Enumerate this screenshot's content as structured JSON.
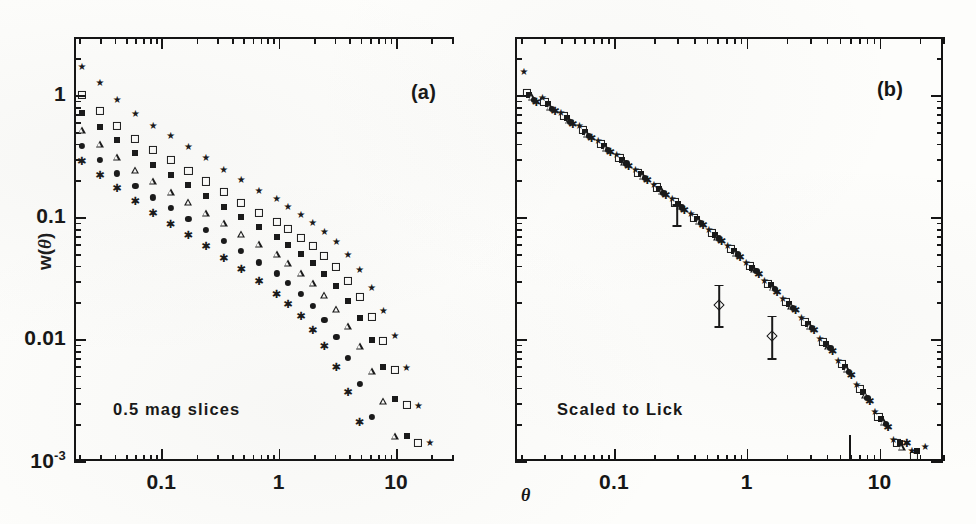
{
  "figure": {
    "type": "scientific-figure",
    "axis_labels": {
      "y": "w(",
      "y_symbol": "θ",
      "y_close": ")",
      "x": "θ"
    }
  },
  "panels": [
    {
      "id": "a",
      "label": "(a)",
      "annotation": "0.5 mag slices"
    },
    {
      "id": "b",
      "label": "(b)",
      "annotation": "Scaled to Lick"
    }
  ],
  "axes": {
    "y_ticks": [
      "1",
      "0.1",
      "0.01",
      "10"
    ],
    "y_last_exponent": "-3",
    "x_ticks_a": [
      "0.1",
      "1",
      "10"
    ],
    "x_ticks_b": [
      "0.1",
      "1",
      "10"
    ],
    "ylim": [
      0.001,
      3.0
    ],
    "xlim": [
      0.018,
      30.0
    ],
    "scale": "log-log"
  },
  "chart_data": {
    "type": "scatter",
    "title": "",
    "xlabel": "θ",
    "ylabel": "w(θ)",
    "xscale": "log",
    "yscale": "log",
    "xlim": [
      0.018,
      30.0
    ],
    "ylim": [
      0.001,
      3.0
    ],
    "grid": false,
    "legend": "none",
    "panels": [
      {
        "id": "a",
        "label": "(a)",
        "annotation": "0.5 mag slices",
        "description": "Angular correlation function w(theta) for six 0.5 magnitude slices; amplitude decreases with fainter magnitude slice.",
        "series": [
          {
            "name": "slice-1-star",
            "marker": "star",
            "x": [
              0.021,
              0.03,
              0.042,
              0.06,
              0.085,
              0.12,
              0.17,
              0.24,
              0.34,
              0.48,
              0.68,
              0.96,
              1.2,
              1.55,
              1.95,
              2.45,
              3.1,
              3.9,
              4.9,
              6.2,
              7.8,
              9.8,
              12.3,
              15.5,
              19.5
            ],
            "y": [
              1.7,
              1.25,
              0.92,
              0.7,
              0.56,
              0.46,
              0.375,
              0.305,
              0.245,
              0.2,
              0.165,
              0.14,
              0.122,
              0.105,
              0.09,
              0.076,
              0.062,
              0.049,
              0.037,
              0.026,
              0.017,
              0.0105,
              0.0058,
              0.0028,
              0.0014
            ]
          },
          {
            "name": "slice-2-open-square",
            "marker": "open-square",
            "x": [
              0.021,
              0.03,
              0.042,
              0.06,
              0.085,
              0.12,
              0.17,
              0.24,
              0.34,
              0.48,
              0.68,
              0.96,
              1.2,
              1.55,
              1.95,
              2.45,
              3.1,
              3.9,
              4.9,
              6.2,
              7.8,
              9.8,
              12.3,
              15.5
            ],
            "y": [
              1.0,
              0.74,
              0.56,
              0.44,
              0.355,
              0.292,
              0.24,
              0.196,
              0.16,
              0.131,
              0.109,
              0.092,
              0.08,
              0.068,
              0.058,
              0.048,
              0.039,
              0.03,
              0.022,
              0.0152,
              0.0096,
              0.0056,
              0.0029,
              0.0014
            ]
          },
          {
            "name": "slice-3-filled-square",
            "marker": "filled-square",
            "x": [
              0.021,
              0.03,
              0.042,
              0.06,
              0.085,
              0.12,
              0.17,
              0.24,
              0.34,
              0.48,
              0.68,
              0.96,
              1.2,
              1.55,
              1.95,
              2.45,
              3.1,
              3.9,
              4.9,
              6.2,
              7.8,
              9.8,
              12.3
            ],
            "y": [
              0.72,
              0.55,
              0.425,
              0.335,
              0.27,
              0.222,
              0.182,
              0.149,
              0.122,
              0.1,
              0.083,
              0.069,
              0.059,
              0.05,
              0.042,
              0.034,
              0.027,
              0.0205,
              0.0148,
              0.0098,
              0.0059,
              0.0032,
              0.0016
            ]
          },
          {
            "name": "slice-4-open-triangle",
            "marker": "open-triangle",
            "x": [
              0.021,
              0.03,
              0.042,
              0.06,
              0.085,
              0.12,
              0.17,
              0.24,
              0.34,
              0.48,
              0.68,
              0.96,
              1.2,
              1.55,
              1.95,
              2.45,
              3.1,
              3.9,
              4.9,
              6.2,
              7.8,
              9.8
            ],
            "y": [
              0.52,
              0.4,
              0.31,
              0.245,
              0.198,
              0.162,
              0.133,
              0.109,
              0.089,
              0.073,
              0.06,
              0.0495,
              0.042,
              0.035,
              0.0288,
              0.023,
              0.0176,
              0.0128,
              0.0088,
              0.0055,
              0.0031,
              0.0016
            ]
          },
          {
            "name": "slice-5-filled-circle",
            "marker": "filled-circle",
            "x": [
              0.021,
              0.03,
              0.042,
              0.06,
              0.085,
              0.12,
              0.17,
              0.24,
              0.34,
              0.48,
              0.68,
              0.96,
              1.2,
              1.55,
              1.95,
              2.45,
              3.1,
              3.9,
              4.9,
              6.2
            ],
            "y": [
              0.385,
              0.295,
              0.228,
              0.18,
              0.145,
              0.119,
              0.097,
              0.079,
              0.064,
              0.0525,
              0.0425,
              0.0345,
              0.0288,
              0.0235,
              0.0188,
              0.0144,
              0.0104,
              0.007,
              0.0043,
              0.0023
            ]
          },
          {
            "name": "slice-6-asterisk",
            "marker": "asterisk",
            "x": [
              0.021,
              0.03,
              0.042,
              0.06,
              0.085,
              0.12,
              0.17,
              0.24,
              0.34,
              0.48,
              0.68,
              0.96,
              1.2,
              1.55,
              1.95,
              2.45,
              3.1,
              3.9,
              4.9
            ],
            "y": [
              0.29,
              0.222,
              0.172,
              0.135,
              0.108,
              0.088,
              0.071,
              0.0575,
              0.0462,
              0.0372,
              0.0298,
              0.0236,
              0.0194,
              0.0154,
              0.0119,
              0.0087,
              0.0059,
              0.0037,
              0.0021
            ]
          }
        ]
      },
      {
        "id": "b",
        "label": "(b)",
        "annotation": "Scaled to Lick",
        "description": "Same six magnitude slices rescaled to the Lick amplitude; all series collapse onto a single power law of slope about -0.8.",
        "series": [
          {
            "name": "scaled-star",
            "marker": "star",
            "x": [
              0.021,
              0.029,
              0.04,
              0.055,
              0.076,
              0.105,
              0.145,
              0.2,
              0.275,
              0.38,
              0.52,
              0.72,
              0.99,
              1.36,
              1.87,
              2.58,
              3.55,
              4.88,
              6.71,
              9.23,
              12.7,
              17.5,
              22.0
            ],
            "y": [
              1.55,
              0.95,
              0.72,
              0.56,
              0.42,
              0.325,
              0.245,
              0.185,
              0.14,
              0.106,
              0.078,
              0.058,
              0.042,
              0.03,
              0.0212,
              0.0148,
              0.01,
              0.0066,
              0.0042,
              0.0025,
              0.0015,
              0.0012,
              0.0013
            ]
          },
          {
            "name": "scaled-open-square",
            "marker": "open-square",
            "x": [
              0.022,
              0.03,
              0.042,
              0.058,
              0.08,
              0.11,
              0.152,
              0.21,
              0.29,
              0.4,
              0.55,
              0.76,
              1.05,
              1.44,
              1.98,
              2.73,
              3.76,
              5.18,
              7.12,
              9.8,
              13.5,
              18.0
            ],
            "y": [
              1.05,
              0.88,
              0.68,
              0.52,
              0.395,
              0.305,
              0.232,
              0.175,
              0.132,
              0.099,
              0.074,
              0.055,
              0.04,
              0.0285,
              0.02,
              0.0138,
              0.0094,
              0.0062,
              0.0039,
              0.0023,
              0.0014,
              0.0011
            ]
          },
          {
            "name": "scaled-filled-square",
            "marker": "filled-square",
            "x": [
              0.023,
              0.032,
              0.044,
              0.061,
              0.084,
              0.116,
              0.16,
              0.22,
              0.305,
              0.42,
              0.58,
              0.8,
              1.1,
              1.52,
              2.09,
              2.88,
              3.96,
              5.45,
              7.5,
              10.3,
              14.2,
              19.0
            ],
            "y": [
              1.0,
              0.84,
              0.65,
              0.5,
              0.385,
              0.295,
              0.225,
              0.17,
              0.128,
              0.096,
              0.072,
              0.053,
              0.0385,
              0.0275,
              0.0194,
              0.0133,
              0.0091,
              0.0059,
              0.0037,
              0.0022,
              0.0014,
              0.0012
            ]
          },
          {
            "name": "scaled-open-triangle",
            "marker": "open-triangle",
            "x": [
              0.024,
              0.033,
              0.046,
              0.063,
              0.087,
              0.12,
              0.166,
              0.229,
              0.316,
              0.436,
              0.601,
              0.829,
              1.14,
              1.58,
              2.17,
              2.99,
              4.12,
              5.68,
              7.82,
              10.8,
              14.8
            ],
            "y": [
              0.96,
              0.8,
              0.62,
              0.48,
              0.37,
              0.285,
              0.218,
              0.165,
              0.124,
              0.093,
              0.069,
              0.051,
              0.0372,
              0.0265,
              0.0186,
              0.0128,
              0.0087,
              0.0057,
              0.0035,
              0.0021,
              0.0013
            ]
          },
          {
            "name": "scaled-filled-circle",
            "marker": "filled-circle",
            "x": [
              0.025,
              0.034,
              0.047,
              0.065,
              0.09,
              0.124,
              0.171,
              0.236,
              0.326,
              0.45,
              0.62,
              0.855,
              1.18,
              1.63,
              2.24,
              3.09,
              4.26,
              5.87,
              8.09,
              11.2
            ],
            "y": [
              0.92,
              0.77,
              0.6,
              0.465,
              0.358,
              0.276,
              0.211,
              0.159,
              0.12,
              0.09,
              0.067,
              0.0495,
              0.036,
              0.0256,
              0.018,
              0.0124,
              0.0084,
              0.0054,
              0.0033,
              0.002
            ]
          },
          {
            "name": "scaled-asterisk",
            "marker": "asterisk",
            "x": [
              0.026,
              0.036,
              0.049,
              0.068,
              0.094,
              0.129,
              0.178,
              0.246,
              0.339,
              0.468,
              0.645,
              0.89,
              1.23,
              1.69,
              2.33,
              3.21,
              4.43,
              6.11,
              8.42,
              11.6,
              16.0
            ],
            "y": [
              0.88,
              0.74,
              0.575,
              0.445,
              0.343,
              0.264,
              0.202,
              0.152,
              0.115,
              0.086,
              0.064,
              0.0473,
              0.0344,
              0.0245,
              0.0172,
              0.0118,
              0.008,
              0.0051,
              0.0031,
              0.0019,
              0.0014
            ]
          }
        ],
        "error_bars": [
          {
            "x": 0.62,
            "y": 0.019,
            "y_low": 0.0128,
            "y_high": 0.028,
            "marker": "open-diamond"
          },
          {
            "x": 1.55,
            "y": 0.0105,
            "y_low": 0.007,
            "y_high": 0.0155,
            "marker": "open-diamond"
          },
          {
            "x": 0.3,
            "y": 0.105,
            "y_low": 0.086,
            "y_high": 0.128,
            "marker": "none"
          }
        ],
        "reference_tick": {
          "x": 5.9,
          "note": "vertical tick near bottom axis"
        }
      }
    ]
  }
}
